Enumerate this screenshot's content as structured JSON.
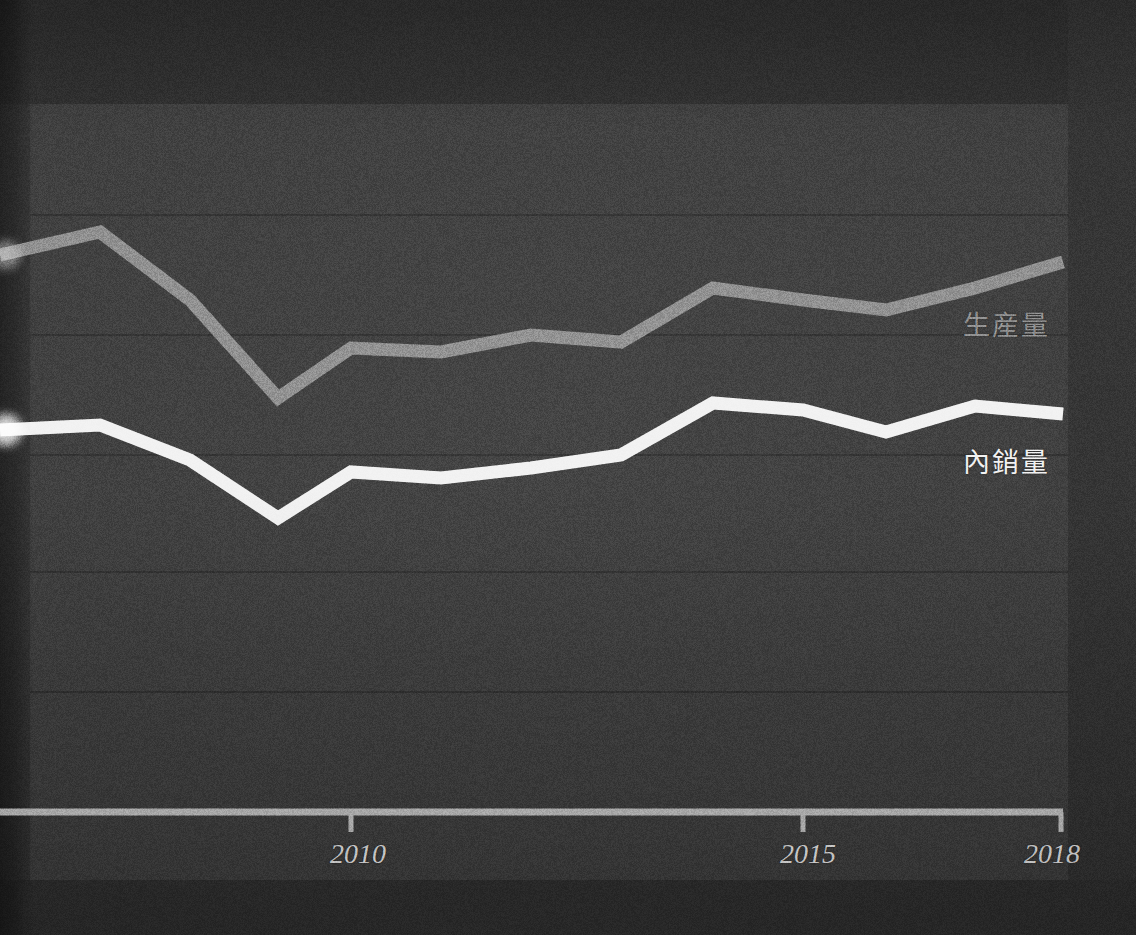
{
  "figure": {
    "background_color": "#323232",
    "panel_color": "#3b3b3b",
    "axis_color": "#b9b9b9",
    "gridline_color": "#2e2e2e"
  },
  "axis": {
    "ticks": [
      {
        "label": "2010",
        "year": 2010
      },
      {
        "label": "2015",
        "year": 2015
      },
      {
        "label": "2018",
        "year": 2018
      }
    ]
  },
  "legend": {
    "production_label": "生産量",
    "domestic_label": "內銷量",
    "production_color": "#8d8d8d",
    "domestic_color": "#f2f2f2"
  },
  "chart_data": {
    "type": "line",
    "title": "",
    "subtitle": "",
    "xlabel": "",
    "ylabel": "",
    "grid": true,
    "legend_position": "right-inline",
    "xlim": [
      2006,
      2018
    ],
    "x": [
      2006,
      2007,
      2008,
      2009,
      2010,
      2011,
      2012,
      2013,
      2014,
      2015,
      2016,
      2017,
      2018
    ],
    "xtick_labels": [
      "",
      "",
      "",
      "",
      "2010",
      "",
      "",
      "",
      "",
      "2015",
      "",
      "",
      "2018"
    ],
    "series": [
      {
        "name": "生産量",
        "color": "#8d8d8d",
        "values_px_y": [
          255,
          232,
          300,
          398,
          348,
          352,
          335,
          342,
          288,
          300,
          310,
          288,
          262
        ]
      },
      {
        "name": "內銷量",
        "color": "#f2f2f2",
        "values_px_y": [
          430,
          425,
          460,
          518,
          472,
          478,
          468,
          455,
          403,
          410,
          432,
          406,
          414
        ]
      }
    ],
    "gridline_y_px": [
      215,
      335,
      455,
      572,
      692
    ],
    "axis_y_px": 812,
    "x_px": [
      0,
      100,
      190,
      278,
      351,
      441,
      531,
      621,
      713,
      803,
      886,
      975,
      1063
    ]
  }
}
